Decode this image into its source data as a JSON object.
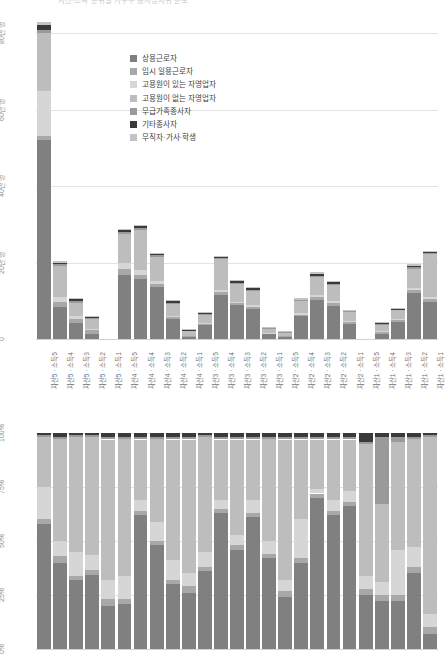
{
  "page": {
    "top_caption": "자산·소득 분위별 가구주 종사상지위 분포"
  },
  "palette": {
    "regular_wage": "#808080",
    "temp_daily_wage": "#a8a8a8",
    "self_employed_with": "#d6d6d6",
    "self_employed_without": "#bdbdbd",
    "unpaid_family": "#9a9a9a",
    "other_worker": "#3a3a3a",
    "inactive": "#c4c4c4",
    "gridline": "#e3e3e3",
    "axis_text": "#8f8f8f",
    "label_text": "#6f6f6f"
  },
  "legend": {
    "items": [
      {
        "label": "상용근로자",
        "key": "regular_wage",
        "color": "#808080"
      },
      {
        "label": "임시 일용근로자",
        "key": "temp_daily_wage",
        "color": "#a8a8a8"
      },
      {
        "label": "고용원이 있는 자영업자",
        "key": "self_employed_with",
        "color": "#d6d6d6"
      },
      {
        "label": "고용원이 없는 자영업자",
        "key": "self_employed_without",
        "color": "#bdbdbd"
      },
      {
        "label": "무급가족종사자",
        "key": "unpaid_family",
        "color": "#9a9a9a"
      },
      {
        "label": "기타종사자",
        "key": "other_worker",
        "color": "#3a3a3a"
      },
      {
        "label": "무직자·가사·학생",
        "key": "inactive",
        "color": "#c4c4c4"
      }
    ]
  },
  "chart_data": [
    {
      "id": "counts",
      "type": "bar",
      "stacked": true,
      "title": "",
      "xlabel": "",
      "ylabel": "",
      "ylim": [
        0,
        80
      ],
      "yunit": "만 명",
      "grid": true,
      "legend_position": "inside-top-center",
      "ytick_labels": [
        "80만 명",
        "60만 명",
        "40만 명",
        "20만 명",
        "0"
      ],
      "ytick_values": [
        80,
        60,
        40,
        20,
        0
      ],
      "categories": [
        "자산5 · 소득5",
        "자산5 · 소득4",
        "자산5 · 소득3",
        "자산5 · 소득2",
        "자산5 · 소득1",
        "자산4 · 소득5",
        "자산4 · 소득4",
        "자산4 · 소득3",
        "자산4 · 소득2",
        "자산4 · 소득1",
        "자산3 · 소득5",
        "자산3 · 소득4",
        "자산3 · 소득3",
        "자산3 · 소득2",
        "자산3 · 소득1",
        "자산2 · 소득5",
        "자산2 · 소득4",
        "자산2 · 소득3",
        "자산2 · 소득2",
        "자산2 · 소득1",
        "자산1 · 소득5",
        "자산1 · 소득4",
        "자산1 · 소득3",
        "자산1 · 소득2",
        "자산1 · 소득1"
      ],
      "series": [
        {
          "name": "상용근로자",
          "key": "regular_wage",
          "values": [
            52.0,
            8.5,
            4.2,
            1.4,
            0.0,
            16.8,
            15.7,
            13.6,
            5.2,
            0.6,
            3.6,
            11.6,
            8.8,
            7.8,
            1.2,
            0.6,
            6.0,
            10.2,
            8.6,
            4.0,
            0.0,
            1.4,
            4.4,
            12.0,
            9.6
          ]
        },
        {
          "name": "임시 일용근로자",
          "key": "temp_daily_wage",
          "values": [
            1.0,
            1.1,
            1.0,
            0.9,
            0.0,
            1.4,
            1.0,
            0.7,
            0.5,
            0.2,
            0.4,
            0.6,
            0.6,
            0.6,
            0.2,
            0.2,
            0.4,
            0.8,
            0.8,
            0.4,
            0.0,
            0.5,
            0.6,
            0.8,
            0.9
          ]
        },
        {
          "name": "고용원이 있는 자영업자",
          "key": "self_employed_with",
          "values": [
            11.8,
            1.4,
            0.9,
            0.3,
            0.0,
            1.6,
            1.3,
            0.8,
            0.3,
            0.1,
            0.2,
            0.6,
            0.4,
            0.4,
            0.1,
            0.1,
            0.3,
            0.6,
            0.5,
            0.2,
            0.0,
            0.2,
            0.3,
            0.6,
            0.5
          ]
        },
        {
          "name": "고용원이 없는 자영업자",
          "key": "self_employed_without",
          "values": [
            15.2,
            8.2,
            3.4,
            2.6,
            0.0,
            7.6,
            10.4,
            6.4,
            3.2,
            1.2,
            2.2,
            8.0,
            4.6,
            3.8,
            1.2,
            0.8,
            3.2,
            4.6,
            4.2,
            2.4,
            0.0,
            1.6,
            2.2,
            5.0,
            11.2
          ]
        },
        {
          "name": "무급가족종사자",
          "key": "unpaid_family",
          "values": [
            0.8,
            0.5,
            0.4,
            0.3,
            0.0,
            0.5,
            0.5,
            0.4,
            0.2,
            0.1,
            0.2,
            0.4,
            0.3,
            0.3,
            0.1,
            0.1,
            0.2,
            0.3,
            0.3,
            0.2,
            0.0,
            0.1,
            0.2,
            0.3,
            0.4
          ]
        },
        {
          "name": "기타종사자",
          "key": "other_worker",
          "values": [
            1.4,
            0.2,
            0.5,
            0.2,
            0.0,
            0.6,
            0.7,
            0.2,
            0.5,
            0.1,
            0.1,
            0.2,
            0.5,
            0.4,
            0.1,
            0.1,
            0.2,
            0.6,
            0.5,
            0.2,
            0.0,
            0.3,
            0.2,
            0.5,
            0.2
          ]
        },
        {
          "name": "무직자·가사·학생",
          "key": "inactive",
          "values": [
            0.6,
            0.4,
            0.3,
            0.2,
            0.0,
            0.3,
            0.3,
            0.2,
            0.2,
            0.1,
            0.1,
            0.2,
            0.2,
            0.2,
            0.1,
            0.1,
            0.1,
            0.2,
            0.2,
            0.1,
            0.0,
            0.1,
            0.1,
            0.2,
            0.2
          ]
        }
      ]
    },
    {
      "id": "share",
      "type": "bar",
      "stacked": true,
      "normalized": true,
      "title": "",
      "xlabel": "",
      "ylabel": "",
      "ylim": [
        0,
        100
      ],
      "grid": true,
      "ytick_labels": [
        "100%",
        "75%",
        "50%",
        "25%",
        "0%"
      ],
      "ytick_values": [
        100,
        75,
        50,
        25,
        0
      ],
      "categories": [
        "자산5 · 소득5",
        "자산5 · 소득4",
        "자산5 · 소득3",
        "자산5 · 소득2",
        "자산5 · 소득1",
        "자산4 · 소득5",
        "자산4 · 소득4",
        "자산4 · 소득3",
        "자산4 · 소득2",
        "자산4 · 소득1",
        "자산3 · 소득5",
        "자산3 · 소득4",
        "자산3 · 소득3",
        "자산3 · 소득2",
        "자산3 · 소득1",
        "자산2 · 소득5",
        "자산2 · 소득4",
        "자산2 · 소득3",
        "자산2 · 소득2",
        "자산2 · 소득1",
        "자산1 · 소득5",
        "자산1 · 소득4",
        "자산1 · 소득3",
        "자산1 · 소득2",
        "자산1 · 소득1"
      ],
      "series": [
        {
          "name": "상용근로자",
          "key": "regular_wage",
          "values": [
            58.0,
            40.0,
            32.0,
            34.0,
            20.0,
            21.0,
            62.0,
            48.0,
            30.0,
            26.0,
            36.0,
            63.0,
            46.0,
            61.0,
            42.0,
            24.0,
            40.0,
            70.0,
            62.0,
            66.0,
            25.0,
            22.0,
            22.0,
            35.0,
            7.0
          ]
        },
        {
          "name": "임시 일용근로자",
          "key": "temp_daily_wage",
          "values": [
            2.0,
            3.0,
            2.0,
            2.0,
            3.0,
            2.0,
            2.0,
            2.0,
            2.0,
            3.0,
            2.0,
            2.0,
            2.0,
            2.0,
            2.0,
            3.0,
            2.0,
            2.0,
            2.0,
            2.0,
            3.0,
            3.0,
            3.0,
            3.0,
            3.0
          ]
        },
        {
          "name": "고용원이 있는 자영업자",
          "key": "self_employed_with",
          "values": [
            15.0,
            7.0,
            11.0,
            7.0,
            9.0,
            11.0,
            5.0,
            9.0,
            9.0,
            6.0,
            7.0,
            4.0,
            5.0,
            6.0,
            6.0,
            5.0,
            18.0,
            2.0,
            5.0,
            5.0,
            6.0,
            6.0,
            21.0,
            9.0,
            6.0
          ]
        },
        {
          "name": "고용원이 없는 자영업자",
          "key": "self_employed_without",
          "values": [
            23.0,
            47.0,
            53.0,
            54.0,
            65.0,
            63.0,
            28.0,
            38.0,
            56.0,
            62.0,
            53.0,
            28.0,
            44.0,
            28.0,
            47.0,
            65.0,
            37.0,
            23.0,
            28.0,
            24.0,
            61.0,
            36.0,
            50.0,
            50.0,
            82.0
          ]
        },
        {
          "name": "무급가족종사자",
          "key": "unpaid_family",
          "values": [
            1.0,
            1.0,
            1.0,
            1.0,
            1.0,
            1.0,
            1.0,
            1.0,
            1.0,
            1.0,
            1.0,
            1.0,
            1.0,
            1.0,
            1.0,
            1.0,
            1.0,
            1.0,
            1.0,
            1.0,
            1.0,
            31.0,
            2.0,
            1.0,
            1.0
          ]
        },
        {
          "name": "기타종사자",
          "key": "other_worker",
          "values": [
            1.0,
            2.0,
            1.0,
            1.0,
            2.0,
            2.0,
            2.0,
            2.0,
            2.0,
            2.0,
            1.0,
            2.0,
            2.0,
            2.0,
            2.0,
            2.0,
            2.0,
            2.0,
            2.0,
            2.0,
            4.0,
            2.0,
            2.0,
            2.0,
            1.0
          ]
        }
      ]
    }
  ]
}
